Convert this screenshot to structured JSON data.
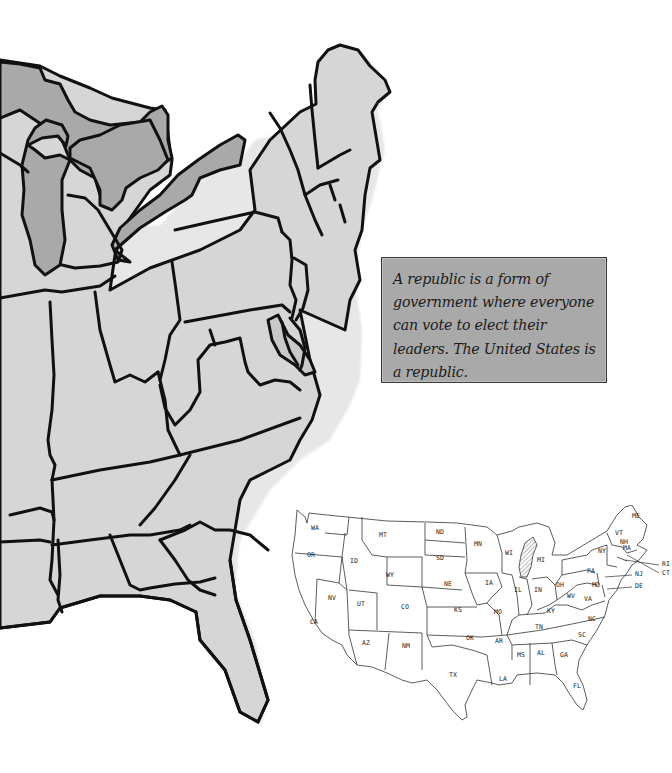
{
  "callout": {
    "text": "A republic is a form of government where everyone can vote to elect their leaders. The United States is a republic.",
    "background": "#a9a9a9",
    "border": "#3a3a3a"
  },
  "eastern_map": {
    "land_fill": "#d4d4d4",
    "water_fill": "#a8a8a8",
    "outline": "#111111"
  },
  "us_map": {
    "highlighted_state": "MI",
    "labels": [
      {
        "code": "WA",
        "x": 24,
        "y": 25
      },
      {
        "code": "OR",
        "x": 20,
        "y": 52
      },
      {
        "code": "CA",
        "x": 23,
        "y": 119
      },
      {
        "code": "ID",
        "x": 63,
        "y": 58
      },
      {
        "code": "NV",
        "x": 41,
        "y": 95
      },
      {
        "code": "MT",
        "x": 92,
        "y": 32
      },
      {
        "code": "WY",
        "x": 99,
        "y": 72
      },
      {
        "code": "UT",
        "x": 70,
        "y": 101
      },
      {
        "code": "AZ",
        "x": 75,
        "y": 140
      },
      {
        "code": "CO",
        "x": 114,
        "y": 104
      },
      {
        "code": "NM",
        "x": 115,
        "y": 143
      },
      {
        "code": "ND",
        "x": 149,
        "y": 29
      },
      {
        "code": "SD",
        "x": 149,
        "y": 55
      },
      {
        "code": "NE",
        "x": 157,
        "y": 81
      },
      {
        "code": "KS",
        "x": 167,
        "y": 107
      },
      {
        "code": "OK",
        "x": 179,
        "y": 135
      },
      {
        "code": "TX",
        "x": 162,
        "y": 172
      },
      {
        "code": "MN",
        "x": 187,
        "y": 41
      },
      {
        "code": "IA",
        "x": 198,
        "y": 80
      },
      {
        "code": "MO",
        "x": 207,
        "y": 109
      },
      {
        "code": "AR",
        "x": 208,
        "y": 138
      },
      {
        "code": "LA",
        "x": 212,
        "y": 176
      },
      {
        "code": "WI",
        "x": 218,
        "y": 50
      },
      {
        "code": "IL",
        "x": 227,
        "y": 87
      },
      {
        "code": "MI",
        "x": 250,
        "y": 57
      },
      {
        "code": "IN",
        "x": 247,
        "y": 87
      },
      {
        "code": "OH",
        "x": 269,
        "y": 82
      },
      {
        "code": "KY",
        "x": 260,
        "y": 108
      },
      {
        "code": "TN",
        "x": 248,
        "y": 124
      },
      {
        "code": "MS",
        "x": 230,
        "y": 152
      },
      {
        "code": "AL",
        "x": 250,
        "y": 150
      },
      {
        "code": "GA",
        "x": 273,
        "y": 152
      },
      {
        "code": "FL",
        "x": 286,
        "y": 183
      },
      {
        "code": "SC",
        "x": 291,
        "y": 132
      },
      {
        "code": "NC",
        "x": 301,
        "y": 116
      },
      {
        "code": "VA",
        "x": 297,
        "y": 96
      },
      {
        "code": "WV",
        "x": 280,
        "y": 93
      },
      {
        "code": "PA",
        "x": 300,
        "y": 68
      },
      {
        "code": "NY",
        "x": 311,
        "y": 48
      },
      {
        "code": "MD",
        "x": 305,
        "y": 82
      },
      {
        "code": "VT",
        "x": 328,
        "y": 30
      },
      {
        "code": "NH",
        "x": 333,
        "y": 39
      },
      {
        "code": "MA",
        "x": 336,
        "y": 45
      },
      {
        "code": "ME",
        "x": 345,
        "y": 13
      },
      {
        "code": "NJ",
        "x": 348,
        "y": 71
      },
      {
        "code": "DE",
        "x": 348,
        "y": 83
      },
      {
        "code": "RI",
        "x": 375,
        "y": 61
      },
      {
        "code": "CT",
        "x": 375,
        "y": 70
      }
    ]
  }
}
